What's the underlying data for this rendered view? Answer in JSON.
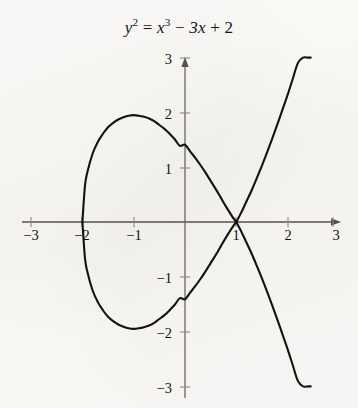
{
  "figure": {
    "name": "elliptic-curve-plot",
    "background_color": "#fbfaf8",
    "ink_color": "#14120f"
  },
  "title": {
    "full_text": "y² = x³ − 3x + 2",
    "lhs_var": "y",
    "lhs_exp": "2",
    "equals": "=",
    "rhs_var": "x",
    "rhs_exp": "3",
    "minus": "−",
    "coef_term": "3x",
    "plus": "+",
    "constant": "2"
  },
  "axes": {
    "x_label_ticks": [
      "−3",
      "−2",
      "−1",
      "1",
      "2",
      "3"
    ],
    "y_label_ticks": [
      "3",
      "2",
      "1",
      "−1",
      "−2",
      "−3"
    ],
    "x_tick_values": [
      -3,
      -2,
      -1,
      1,
      2,
      3
    ],
    "y_tick_values": [
      3,
      2,
      1,
      -1,
      -2,
      -3
    ],
    "origin_label": "",
    "arrow_x": "right",
    "arrow_y": "up"
  },
  "chart_data": {
    "type": "line",
    "xlabel": "x",
    "ylabel": "y",
    "equation": "y^2 = x^3 - 3x + 2",
    "xlim": [
      -3,
      3
    ],
    "ylim": [
      -3,
      3
    ],
    "grid": false,
    "legend": null,
    "x_ticks": [
      -3,
      -2,
      -1,
      1,
      2,
      3
    ],
    "y_ticks": [
      -3,
      -2,
      -1,
      1,
      2,
      3
    ],
    "notes": [
      "Singular cubic (nodal) curve: y^2 = (x-1)^2 (x+2)",
      "Node / self-intersection at (1, 0)",
      "Left x-intercept at (-2, 0)",
      "Oval component spans x from -2 to 1, max |y| ≈ 1.95 near x = -1",
      "Unbounded branches leave the frame near x ≈ 2.45"
    ],
    "key_points": [
      {
        "label": "left x-intercept",
        "x": -2,
        "y": 0
      },
      {
        "label": "oval top",
        "x": -1,
        "y": 1.95
      },
      {
        "label": "oval bottom",
        "x": -1,
        "y": -1.95
      },
      {
        "label": "y-intercept upper",
        "x": 0,
        "y": 1.41
      },
      {
        "label": "y-intercept lower",
        "x": 0,
        "y": -1.41
      },
      {
        "label": "node",
        "x": 1,
        "y": 0
      }
    ],
    "series": [
      {
        "name": "oval-component-upper",
        "x": [
          -2.0,
          -1.95,
          -1.9,
          -1.8,
          -1.7,
          -1.6,
          -1.5,
          -1.4,
          -1.3,
          -1.2,
          -1.1,
          -1.0,
          -0.9,
          -0.8,
          -0.7,
          -0.6,
          -0.5,
          -0.4,
          -0.3,
          -0.2,
          -0.1,
          0.0,
          0.1,
          0.2,
          0.3,
          0.4,
          0.5,
          0.6,
          0.7,
          0.8,
          0.9,
          0.95,
          1.0
        ],
        "y": [
          0.0,
          0.66,
          0.92,
          1.25,
          1.46,
          1.61,
          1.73,
          1.81,
          1.87,
          1.91,
          1.94,
          1.95,
          1.94,
          1.92,
          1.89,
          1.84,
          1.77,
          1.7,
          1.61,
          1.51,
          1.39,
          1.41,
          1.29,
          1.17,
          1.04,
          0.9,
          0.75,
          0.6,
          0.44,
          0.28,
          0.13,
          0.06,
          0.0
        ]
      },
      {
        "name": "oval-component-lower",
        "x": [
          -2.0,
          -1.95,
          -1.9,
          -1.8,
          -1.7,
          -1.6,
          -1.5,
          -1.4,
          -1.3,
          -1.2,
          -1.1,
          -1.0,
          -0.9,
          -0.8,
          -0.7,
          -0.6,
          -0.5,
          -0.4,
          -0.3,
          -0.2,
          -0.1,
          0.0,
          0.1,
          0.2,
          0.3,
          0.4,
          0.5,
          0.6,
          0.7,
          0.8,
          0.9,
          0.95,
          1.0
        ],
        "y": [
          0.0,
          -0.66,
          -0.92,
          -1.25,
          -1.46,
          -1.61,
          -1.73,
          -1.81,
          -1.87,
          -1.91,
          -1.94,
          -1.95,
          -1.94,
          -1.92,
          -1.89,
          -1.84,
          -1.77,
          -1.7,
          -1.61,
          -1.51,
          -1.39,
          -1.41,
          -1.29,
          -1.17,
          -1.04,
          -0.9,
          -0.75,
          -0.6,
          -0.44,
          -0.28,
          -0.13,
          -0.06,
          0.0
        ]
      },
      {
        "name": "unbounded-branch-upper",
        "x": [
          1.0,
          1.1,
          1.2,
          1.3,
          1.4,
          1.5,
          1.6,
          1.7,
          1.8,
          1.9,
          2.0,
          2.1,
          2.2,
          2.3,
          2.4,
          2.45
        ],
        "y": [
          0.0,
          0.18,
          0.38,
          0.58,
          0.8,
          1.03,
          1.27,
          1.52,
          1.78,
          2.05,
          2.32,
          2.61,
          2.9,
          3.0,
          3.0,
          3.0
        ]
      },
      {
        "name": "unbounded-branch-lower",
        "x": [
          1.0,
          1.1,
          1.2,
          1.3,
          1.4,
          1.5,
          1.6,
          1.7,
          1.8,
          1.9,
          2.0,
          2.1,
          2.2,
          2.3,
          2.4,
          2.45
        ],
        "y": [
          0.0,
          -0.18,
          -0.38,
          -0.58,
          -0.8,
          -1.03,
          -1.27,
          -1.52,
          -1.78,
          -2.05,
          -2.32,
          -2.61,
          -2.9,
          -3.0,
          -3.0,
          -3.0
        ]
      }
    ]
  }
}
